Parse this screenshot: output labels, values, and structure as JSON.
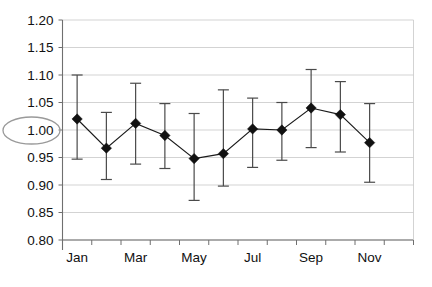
{
  "chart_data": {
    "type": "line",
    "title": "",
    "subtitle": "",
    "xlabel": "",
    "ylabel": "",
    "ylim": [
      0.8,
      1.2
    ],
    "y_tick_step": 0.05,
    "grid": true,
    "legend": null,
    "legend_position": "none",
    "categories": [
      "Jan",
      "Feb",
      "Mar",
      "Apr",
      "May",
      "Jun",
      "Jul",
      "Aug",
      "Sep",
      "Oct",
      "Nov",
      "Dec"
    ],
    "visible_x_tick_labels": [
      "Jan",
      "Mar",
      "May",
      "Jul",
      "Sep",
      "Nov"
    ],
    "y_tick_labels": [
      "1.20",
      "1.15",
      "1.10",
      "1.05",
      "1.00",
      "0.95",
      "0.90",
      "0.85",
      "0.80"
    ],
    "series": [
      {
        "name": "index",
        "marker": "diamond",
        "values": [
          1.02,
          0.967,
          1.012,
          0.99,
          0.948,
          0.957,
          1.002,
          1.0,
          1.04,
          1.028,
          0.977,
          null
        ],
        "error_upper": [
          1.1,
          1.032,
          1.085,
          1.048,
          1.03,
          1.073,
          1.058,
          1.05,
          1.11,
          1.088,
          1.048,
          null
        ],
        "error_lower": [
          0.947,
          0.91,
          0.938,
          0.93,
          0.872,
          0.898,
          0.932,
          0.945,
          0.968,
          0.96,
          0.905,
          null
        ]
      }
    ],
    "annotations": [
      {
        "type": "ellipse-highlight",
        "target": "y-axis-label-1.00",
        "label": "1.00",
        "color": "#9a9a9a"
      }
    ],
    "colors": {
      "marker": "#111111",
      "line": "#1a1a1a",
      "error_bar": "#4a4a4a",
      "gridline": "#c8c8c8",
      "axis": "#6f6f6f",
      "background": "#ffffff",
      "highlight": "#9a9a9a"
    }
  }
}
